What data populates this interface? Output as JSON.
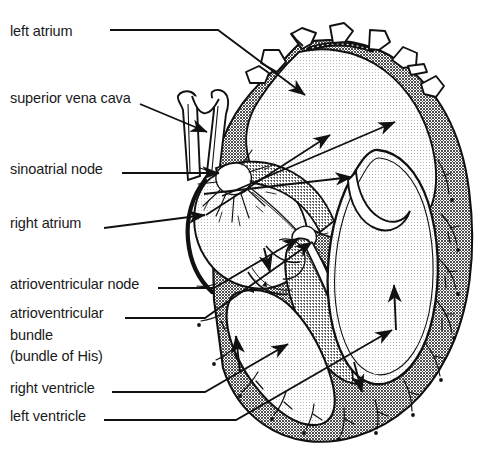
{
  "diagram": {
    "colors": {
      "ink": "#111111",
      "label_text": "#1a1a1a",
      "chamber_stipple": "#f0f0f0",
      "myocardium_dark": "#8a8a8a",
      "myocardium_mid": "#6f6f6f",
      "vessel_fill": "#ffffff",
      "background": "#ffffff"
    },
    "labels": [
      {
        "id": "left-atrium",
        "text": "left atrium",
        "x": 10,
        "y": 22,
        "leader": "horizontal then diagonal to upper chamber"
      },
      {
        "id": "superior-vena-cava",
        "text": "superior vena cava",
        "x": 10,
        "y": 89,
        "leader": "diagonal arrow to vena cava tube"
      },
      {
        "id": "sinoatrial-node",
        "text": "sinoatrial node",
        "x": 10,
        "y": 160,
        "leader": "horizontal arrow to node starburst"
      },
      {
        "id": "right-atrium",
        "text": "right atrium",
        "x": 10,
        "y": 214,
        "leader": "horizontal arrow into right atrium"
      },
      {
        "id": "atrioventricular-node",
        "text": "atrioventricular node",
        "x": 10,
        "y": 275,
        "leader": "horizontal then diagonal to AV node"
      },
      {
        "id": "atrioventricular-bundle",
        "text": "atrioventricular\nbundle\n(bundle of His)",
        "x": 10,
        "y": 304,
        "leader": "horizontal then diagonal to bundle fibers"
      },
      {
        "id": "right-ventricle",
        "text": "right ventricle",
        "x": 10,
        "y": 379,
        "leader": "horizontal then diagonal into right ventricle"
      },
      {
        "id": "left-ventricle",
        "text": "left ventricle",
        "x": 10,
        "y": 407,
        "leader": "horizontal then diagonal into left ventricle"
      }
    ],
    "structures": [
      "pulmonary vessel stubs",
      "superior vena cava",
      "sinoatrial node",
      "atrioventricular node",
      "bundle of His",
      "purkinje fibers",
      "interventricular septum",
      "myocardial wall"
    ]
  }
}
